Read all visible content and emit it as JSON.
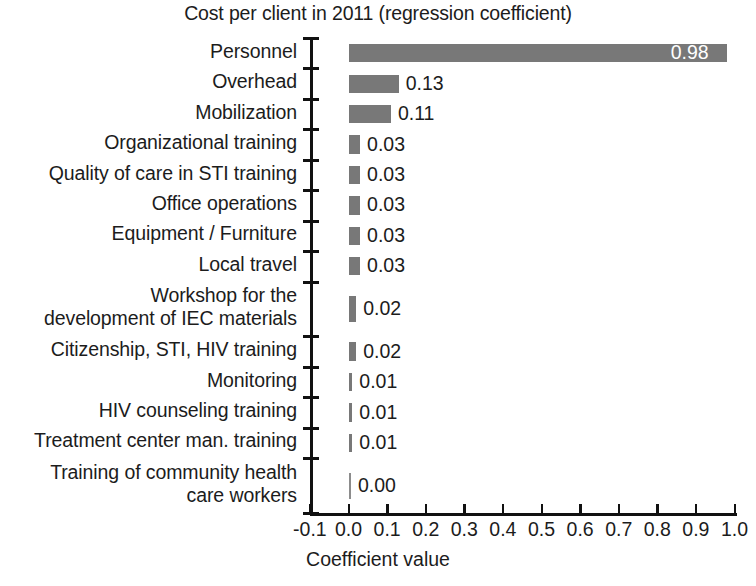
{
  "chart_data": {
    "type": "bar",
    "orientation": "horizontal",
    "title": "Cost per client in 2011 (regression coefficient)",
    "xlabel": "Coefficient value",
    "ylabel": "",
    "xlim": [
      -0.1,
      1.0
    ],
    "xticks": [
      "-0.1",
      "0.0",
      "0.1",
      "0.2",
      "0.3",
      "0.4",
      "0.5",
      "0.6",
      "0.7",
      "0.8",
      "0.9",
      "1.0"
    ],
    "xtick_values": [
      -0.1,
      0.0,
      0.1,
      0.2,
      0.3,
      0.4,
      0.5,
      0.6,
      0.7,
      0.8,
      0.9,
      1.0
    ],
    "grid": false,
    "legend": false,
    "bar_color": "#787878",
    "categories": [
      "Personnel",
      "Overhead",
      "Mobilization",
      "Organizational training",
      "Quality of care in STI training",
      "Office operations",
      "Equipment / Furniture",
      "Local travel",
      "Workshop for the\ndevelopment of IEC materials",
      "Citizenship, STI, HIV training",
      "Monitoring",
      "HIV counseling training",
      "Treatment center man. training",
      "Training of community health\ncare workers"
    ],
    "values": [
      0.98,
      0.13,
      0.11,
      0.03,
      0.03,
      0.03,
      0.03,
      0.03,
      0.02,
      0.02,
      0.01,
      0.01,
      0.01,
      0.0
    ],
    "value_labels": [
      "0.98",
      "0.13",
      "0.11",
      "0.03",
      "0.03",
      "0.03",
      "0.03",
      "0.03",
      "0.02",
      "0.02",
      "0.01",
      "0.01",
      "0.01",
      "0.00"
    ],
    "label_positions": [
      "inside",
      "outside",
      "outside",
      "outside",
      "outside",
      "outside",
      "outside",
      "outside",
      "outside",
      "outside",
      "outside",
      "outside",
      "outside",
      "outside"
    ]
  }
}
